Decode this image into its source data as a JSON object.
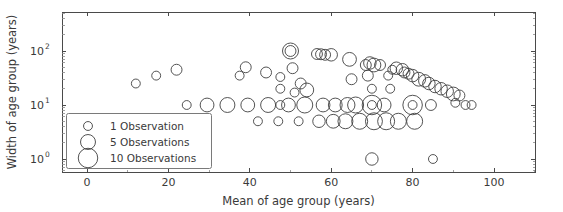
{
  "chart_data": {
    "type": "scatter",
    "title": "",
    "xlabel": "Mean of age group (years)",
    "ylabel": "Width of age group (years)",
    "xlim": [
      -6,
      112
    ],
    "ylim": [
      0.55,
      330
    ],
    "yscale": "log",
    "xscale": "linear",
    "grid": false,
    "xticks": [
      0,
      20,
      40,
      60,
      80,
      100
    ],
    "xtick_labels": [
      "0",
      "20",
      "40",
      "60",
      "80",
      "100"
    ],
    "yticks": [
      1,
      10,
      100
    ],
    "ytick_labels": [
      "10⁰",
      "10¹",
      "10²"
    ],
    "ytick_mantissa": [
      "10",
      "10",
      "10"
    ],
    "ytick_exponent": [
      "0",
      "1",
      "2"
    ],
    "marker": "open-circle",
    "marker_color": "#404040",
    "size_encoding": "number of observations",
    "legend": {
      "position": "lower left",
      "entries": [
        {
          "label": "1 Observation",
          "observations": 1
        },
        {
          "label": "5 Observations",
          "observations": 5
        },
        {
          "label": "10 Observations",
          "observations": 10
        }
      ]
    },
    "points": [
      {
        "x": 12,
        "y": 25,
        "n": 1
      },
      {
        "x": 17,
        "y": 35,
        "n": 1
      },
      {
        "x": 22,
        "y": 45,
        "n": 2
      },
      {
        "x": 24.5,
        "y": 10,
        "n": 1
      },
      {
        "x": 29.5,
        "y": 10,
        "n": 4
      },
      {
        "x": 34.5,
        "y": 10,
        "n": 5
      },
      {
        "x": 37.5,
        "y": 35,
        "n": 1
      },
      {
        "x": 39,
        "y": 50,
        "n": 2
      },
      {
        "x": 39.5,
        "y": 10,
        "n": 4
      },
      {
        "x": 42,
        "y": 5,
        "n": 1
      },
      {
        "x": 44,
        "y": 40,
        "n": 2
      },
      {
        "x": 44.5,
        "y": 10,
        "n": 5
      },
      {
        "x": 47,
        "y": 5,
        "n": 1
      },
      {
        "x": 47.5,
        "y": 20,
        "n": 1
      },
      {
        "x": 47.5,
        "y": 33,
        "n": 1
      },
      {
        "x": 47.5,
        "y": 10,
        "n": 1
      },
      {
        "x": 49.5,
        "y": 10,
        "n": 4
      },
      {
        "x": 50,
        "y": 100,
        "n": 6
      },
      {
        "x": 50,
        "y": 100,
        "n": 2
      },
      {
        "x": 50.5,
        "y": 48,
        "n": 2
      },
      {
        "x": 51,
        "y": 17,
        "n": 1
      },
      {
        "x": 52,
        "y": 5,
        "n": 1
      },
      {
        "x": 52.5,
        "y": 25,
        "n": 2
      },
      {
        "x": 53.5,
        "y": 10,
        "n": 6
      },
      {
        "x": 54,
        "y": 19,
        "n": 4
      },
      {
        "x": 56.5,
        "y": 88,
        "n": 2
      },
      {
        "x": 57,
        "y": 5,
        "n": 3
      },
      {
        "x": 57.5,
        "y": 87,
        "n": 2
      },
      {
        "x": 58,
        "y": 10,
        "n": 4
      },
      {
        "x": 58.5,
        "y": 85,
        "n": 2
      },
      {
        "x": 60,
        "y": 85,
        "n": 3
      },
      {
        "x": 60.5,
        "y": 5,
        "n": 4
      },
      {
        "x": 61,
        "y": 10,
        "n": 4
      },
      {
        "x": 63.5,
        "y": 5,
        "n": 5
      },
      {
        "x": 64,
        "y": 10,
        "n": 5
      },
      {
        "x": 64.5,
        "y": 70,
        "n": 4
      },
      {
        "x": 65,
        "y": 30,
        "n": 2
      },
      {
        "x": 66,
        "y": 10,
        "n": 6
      },
      {
        "x": 67,
        "y": 5,
        "n": 6
      },
      {
        "x": 68.5,
        "y": 55,
        "n": 2
      },
      {
        "x": 69,
        "y": 35,
        "n": 2
      },
      {
        "x": 69.5,
        "y": 60,
        "n": 3
      },
      {
        "x": 70,
        "y": 1,
        "n": 3
      },
      {
        "x": 70,
        "y": 10,
        "n": 10
      },
      {
        "x": 70,
        "y": 10,
        "n": 1
      },
      {
        "x": 70,
        "y": 20,
        "n": 1
      },
      {
        "x": 70.5,
        "y": 55,
        "n": 4
      },
      {
        "x": 70.5,
        "y": 5,
        "n": 7
      },
      {
        "x": 72,
        "y": 55,
        "n": 2
      },
      {
        "x": 73,
        "y": 10,
        "n": 4
      },
      {
        "x": 73.5,
        "y": 5,
        "n": 7
      },
      {
        "x": 74,
        "y": 35,
        "n": 1
      },
      {
        "x": 74.5,
        "y": 20,
        "n": 1
      },
      {
        "x": 75,
        "y": 45,
        "n": 1
      },
      {
        "x": 76,
        "y": 48,
        "n": 3
      },
      {
        "x": 76.5,
        "y": 5,
        "n": 6
      },
      {
        "x": 77.5,
        "y": 45,
        "n": 3
      },
      {
        "x": 78,
        "y": 40,
        "n": 2
      },
      {
        "x": 79,
        "y": 38,
        "n": 2
      },
      {
        "x": 80,
        "y": 10,
        "n": 10
      },
      {
        "x": 80,
        "y": 10,
        "n": 1
      },
      {
        "x": 80,
        "y": 35,
        "n": 3
      },
      {
        "x": 80.5,
        "y": 5,
        "n": 6
      },
      {
        "x": 81.5,
        "y": 30,
        "n": 4
      },
      {
        "x": 83,
        "y": 28,
        "n": 3
      },
      {
        "x": 84,
        "y": 25,
        "n": 3
      },
      {
        "x": 84.5,
        "y": 10,
        "n": 2
      },
      {
        "x": 85,
        "y": 1,
        "n": 1
      },
      {
        "x": 85.5,
        "y": 22,
        "n": 3
      },
      {
        "x": 87,
        "y": 20,
        "n": 3
      },
      {
        "x": 88.5,
        "y": 18,
        "n": 3
      },
      {
        "x": 90,
        "y": 16,
        "n": 4
      },
      {
        "x": 90.5,
        "y": 11,
        "n": 1
      },
      {
        "x": 91.5,
        "y": 15,
        "n": 2
      },
      {
        "x": 93,
        "y": 10,
        "n": 1
      },
      {
        "x": 94.5,
        "y": 10,
        "n": 1
      }
    ]
  },
  "geometry": {
    "plot_left": 62,
    "plot_right": 535,
    "plot_top": 12,
    "plot_bottom": 172,
    "x_zero_px": 87,
    "x_px_per_unit": 4.07,
    "y_decade_px": 54,
    "y_one_px": 159
  }
}
